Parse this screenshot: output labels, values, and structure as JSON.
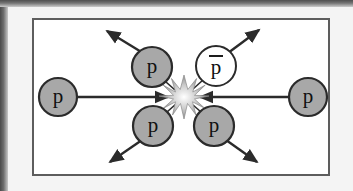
{
  "figure": {
    "kind": "particle-collision-diagram",
    "panel": {
      "background_color": "#ffffff",
      "border_color": "#5d5d5d"
    },
    "page_background_color": "#f4f4f4",
    "scan_edge_color": "#4f4f4f"
  },
  "colors": {
    "proton_fill": "#a8a8a8",
    "antiproton_fill": "#ffffff",
    "outline": "#2b2b2b",
    "beam_line": "#2b2b2b",
    "burst": "#9a9a9a",
    "label_text": "#111111"
  },
  "center": {
    "name": "collision-burst",
    "label": "",
    "x": 184,
    "y": 97,
    "points": 12,
    "outer_radius": 22,
    "inner_radius": 7
  },
  "beams": [
    {
      "name": "incoming-beam-left",
      "particle": "p",
      "direction": "rightward",
      "circle": {
        "cx": 58,
        "cy": 97,
        "r": 19
      },
      "line": {
        "x1": 77,
        "y1": 97,
        "x2": 168,
        "y2": 97
      },
      "arrow_at": "end"
    },
    {
      "name": "incoming-beam-right",
      "particle": "p",
      "direction": "leftward",
      "circle": {
        "cx": 308,
        "cy": 97,
        "r": 19
      },
      "line": {
        "x1": 289,
        "y1": 97,
        "x2": 200,
        "y2": 97
      },
      "arrow_at": "end"
    }
  ],
  "outgoing": [
    {
      "name": "outgoing-proton-upper-left",
      "particle": "p",
      "filled": true,
      "circle": {
        "cx": 152,
        "cy": 67,
        "r": 20
      },
      "line": {
        "x1": 141,
        "y1": 51,
        "x2": 107,
        "y2": 30
      },
      "arrow_at": "end"
    },
    {
      "name": "outgoing-antiproton-upper-right",
      "particle": "p̄",
      "filled": false,
      "circle": {
        "cx": 216,
        "cy": 66,
        "r": 20
      },
      "line": {
        "x1": 229,
        "y1": 52,
        "x2": 259,
        "y2": 29
      },
      "arrow_at": "end"
    },
    {
      "name": "outgoing-proton-lower-left",
      "particle": "p",
      "filled": true,
      "circle": {
        "cx": 153,
        "cy": 126,
        "r": 20
      },
      "line": {
        "x1": 141,
        "y1": 141,
        "x2": 110,
        "y2": 163
      },
      "arrow_at": "end"
    },
    {
      "name": "outgoing-proton-lower-right",
      "particle": "p",
      "filled": true,
      "circle": {
        "cx": 214,
        "cy": 126,
        "r": 20
      },
      "line": {
        "x1": 227,
        "y1": 141,
        "x2": 257,
        "y2": 163
      },
      "arrow_at": "end"
    }
  ],
  "labels": {
    "proton": "p",
    "antiproton": "p",
    "antiproton_bar": true
  }
}
